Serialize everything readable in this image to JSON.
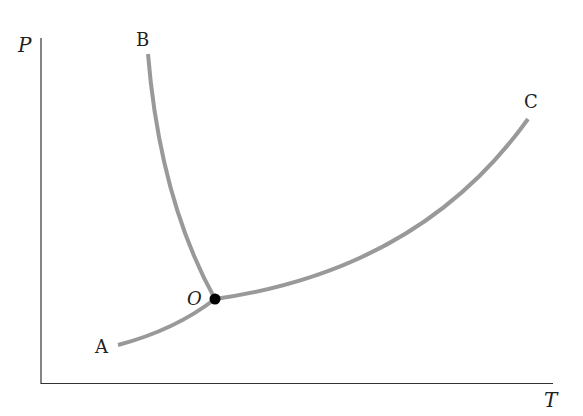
{
  "diagram": {
    "type": "phase diagram (P-T)",
    "axes": {
      "y_label": "P",
      "x_label": "T"
    },
    "curves": [
      {
        "name": "OA",
        "end_label": "A",
        "description": "sublimation curve from A to triple point O"
      },
      {
        "name": "OB",
        "end_label": "B",
        "description": "fusion curve from O up to B"
      },
      {
        "name": "OC",
        "end_label": "C",
        "description": "vaporization curve from O to C"
      }
    ],
    "point": {
      "label": "O",
      "description": "triple point"
    },
    "colors": {
      "curve": "#999999",
      "axis": "#333333",
      "point": "#000000"
    }
  }
}
